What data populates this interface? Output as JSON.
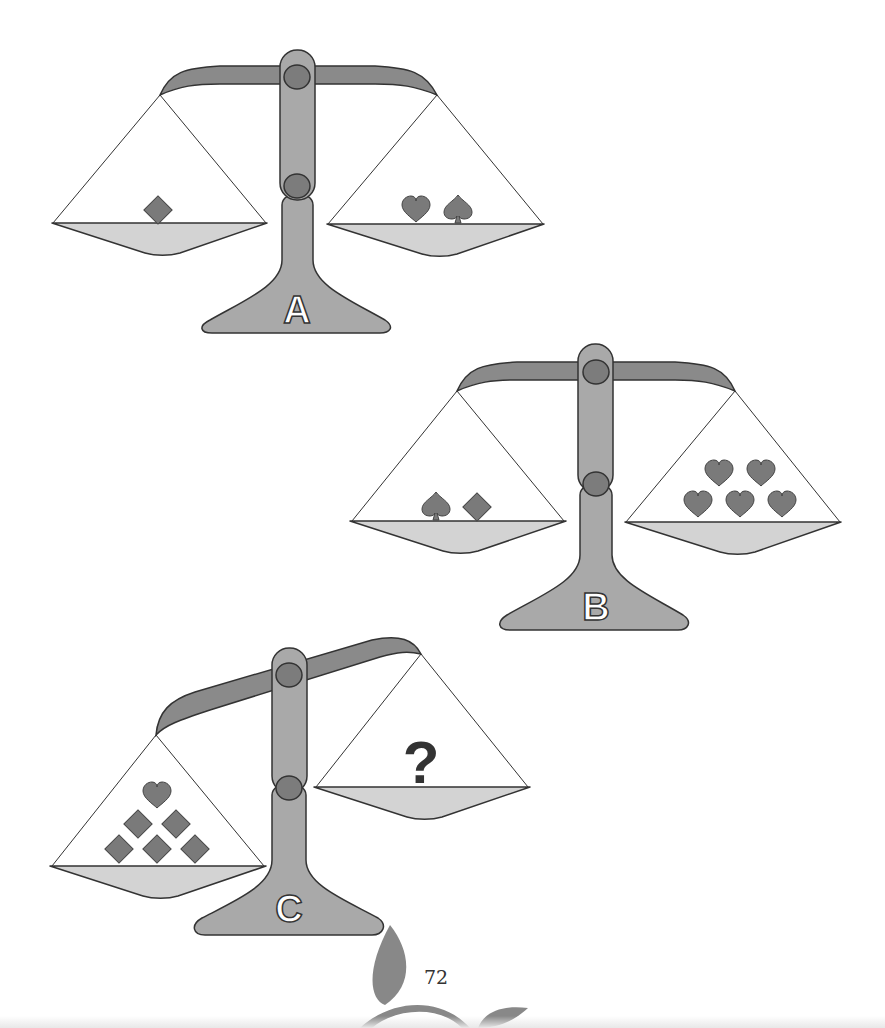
{
  "puzzle": {
    "type": "balance-scale-puzzle",
    "colors": {
      "beam": "#8a8a8a",
      "post": "#a9a9a9",
      "pivot": "#7c7c7c",
      "pan": "#d3d3d3",
      "symbol": "#7a7a7a",
      "outline": "#333333"
    },
    "scales": [
      {
        "label": "A",
        "state": "balanced",
        "left_pan": [
          "diamond"
        ],
        "right_pan": [
          "heart",
          "spade"
        ]
      },
      {
        "label": "B",
        "state": "balanced",
        "left_pan": [
          "spade",
          "diamond"
        ],
        "right_pan": [
          "heart",
          "heart",
          "heart",
          "heart",
          "heart"
        ]
      },
      {
        "label": "C",
        "state": "tilted-left-down",
        "left_pan": [
          "heart",
          "diamond",
          "diamond",
          "diamond",
          "diamond",
          "diamond"
        ],
        "right_pan": [
          "?"
        ]
      }
    ]
  },
  "page": {
    "number": "72"
  }
}
